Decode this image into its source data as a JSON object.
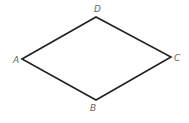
{
  "diagram": {
    "type": "rhombus",
    "stroke_color": "#222222",
    "label_color": "#666666",
    "vertices": [
      {
        "name": "A",
        "x": 22,
        "y": 59,
        "label_x": 13,
        "label_y": 63
      },
      {
        "name": "B",
        "x": 96,
        "y": 100,
        "label_x": 90,
        "label_y": 111
      },
      {
        "name": "C",
        "x": 171,
        "y": 57,
        "label_x": 174,
        "label_y": 61
      },
      {
        "name": "D",
        "x": 96,
        "y": 17,
        "label_x": 94,
        "label_y": 12
      }
    ],
    "labels": {
      "a": "A",
      "b": "B",
      "c": "C",
      "d": "D"
    }
  }
}
